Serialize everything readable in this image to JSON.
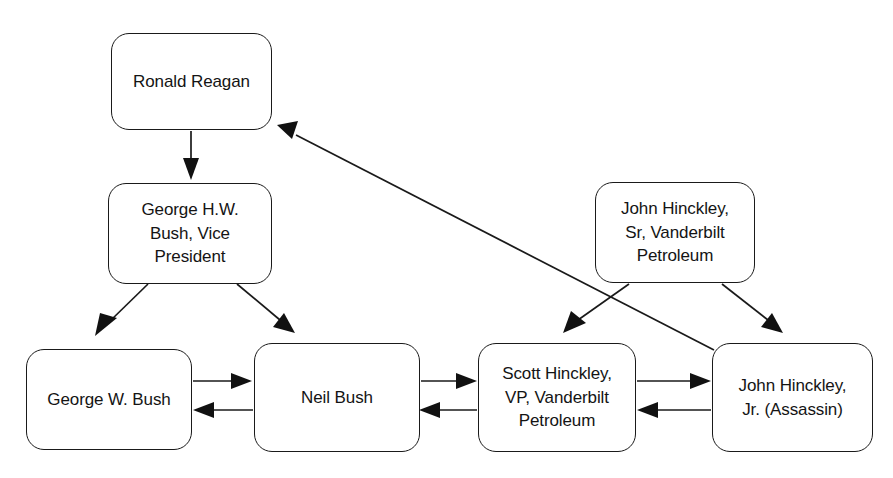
{
  "diagram": {
    "background_color": "#ffffff",
    "stroke_color": "#1a1a1a",
    "nodes": [
      {
        "id": "ronald-reagan",
        "label": "Ronald Reagan",
        "x": 111,
        "y": 33,
        "w": 161,
        "h": 97
      },
      {
        "id": "george-hw-bush",
        "label": "George H.W.\nBush, Vice\nPresident",
        "x": 108,
        "y": 183,
        "w": 164,
        "h": 101
      },
      {
        "id": "john-hinckley-sr",
        "label": "John Hinckley,\nSr, Vanderbilt\nPetroleum",
        "x": 595,
        "y": 182,
        "w": 160,
        "h": 101
      },
      {
        "id": "george-w-bush",
        "label": "George W. Bush",
        "x": 26,
        "y": 349,
        "w": 166,
        "h": 101
      },
      {
        "id": "neil-bush",
        "label": "Neil Bush",
        "x": 254,
        "y": 343,
        "w": 166,
        "h": 109
      },
      {
        "id": "scott-hinckley",
        "label": "Scott Hinckley,\nVP, Vanderbilt\nPetroleum",
        "x": 478,
        "y": 343,
        "w": 158,
        "h": 109
      },
      {
        "id": "john-hinckley-jr",
        "label": "John Hinckley,\nJr. (Assassin)",
        "x": 712,
        "y": 343,
        "w": 161,
        "h": 109
      }
    ],
    "edges": [
      {
        "id": "reagan-to-ghw-bush",
        "from": "ronald-reagan",
        "to": "george-hw-bush",
        "direction": "down"
      },
      {
        "id": "ghw-bush-to-george-w-bush",
        "from": "george-hw-bush",
        "to": "george-w-bush",
        "direction": "down-left"
      },
      {
        "id": "ghw-bush-to-neil-bush",
        "from": "george-hw-bush",
        "to": "neil-bush",
        "direction": "down-right"
      },
      {
        "id": "hinckley-sr-to-scott",
        "from": "john-hinckley-sr",
        "to": "scott-hinckley",
        "direction": "down-left"
      },
      {
        "id": "hinckley-sr-to-hinckley-jr",
        "from": "john-hinckley-sr",
        "to": "john-hinckley-jr",
        "direction": "down-right"
      },
      {
        "id": "hinckley-jr-to-reagan",
        "from": "john-hinckley-jr",
        "to": "ronald-reagan",
        "direction": "up-left"
      },
      {
        "id": "george-w-bush-to-neil-bush",
        "from": "george-w-bush",
        "to": "neil-bush",
        "direction": "right"
      },
      {
        "id": "neil-bush-to-george-w-bush",
        "from": "neil-bush",
        "to": "george-w-bush",
        "direction": "left"
      },
      {
        "id": "neil-bush-to-scott",
        "from": "neil-bush",
        "to": "scott-hinckley",
        "direction": "right"
      },
      {
        "id": "scott-to-neil-bush",
        "from": "scott-hinckley",
        "to": "neil-bush",
        "direction": "left"
      },
      {
        "id": "scott-to-hinckley-jr",
        "from": "scott-hinckley",
        "to": "john-hinckley-jr",
        "direction": "right"
      },
      {
        "id": "hinckley-jr-to-scott",
        "from": "john-hinckley-jr",
        "to": "scott-hinckley",
        "direction": "left"
      }
    ]
  }
}
